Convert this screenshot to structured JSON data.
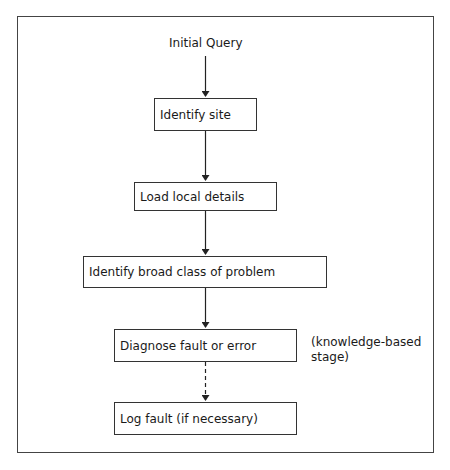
{
  "diagram": {
    "start": "Initial Query",
    "steps": [
      {
        "label": "Identify site"
      },
      {
        "label": "Load local details"
      },
      {
        "label": "Identify broad class of problem"
      },
      {
        "label": "Diagnose fault or error"
      },
      {
        "label": "Log fault (if necessary)"
      }
    ],
    "annotation": {
      "line1": "(knowledge-based",
      "line2": "stage)"
    },
    "edges": [
      {
        "from": "Initial Query",
        "to": "Identify site",
        "style": "solid"
      },
      {
        "from": "Identify site",
        "to": "Load local details",
        "style": "solid"
      },
      {
        "from": "Load local details",
        "to": "Identify broad class of problem",
        "style": "solid"
      },
      {
        "from": "Identify broad class of problem",
        "to": "Diagnose fault or error",
        "style": "solid"
      },
      {
        "from": "Diagnose fault or error",
        "to": "Log fault (if necessary)",
        "style": "dashed"
      }
    ]
  }
}
